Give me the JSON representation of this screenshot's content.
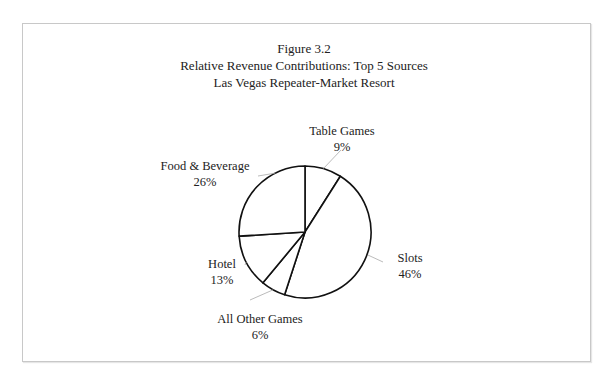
{
  "chart_data": {
    "type": "pie",
    "title": "Figure 3.2",
    "subtitle": [
      "Relative Revenue Contributions: Top 5 Sources",
      "Las Vegas Repeater-Market Resort"
    ],
    "categories": [
      "Table Games",
      "Slots",
      "All Other Games",
      "Hotel",
      "Food & Beverage"
    ],
    "values": [
      9,
      46,
      6,
      13,
      26
    ],
    "value_labels": [
      "9%",
      "46%",
      "6%",
      "13%",
      "26%"
    ],
    "start_angle": "12 o'clock",
    "direction": "clockwise",
    "legend": "none (callout labels)",
    "fill": "#ffffff",
    "stroke": "#111111"
  },
  "figure": {
    "number": "Figure 3.2",
    "line1": "Relative Revenue Contributions: Top 5 Sources",
    "line2": "Las Vegas Repeater-Market Resort"
  }
}
